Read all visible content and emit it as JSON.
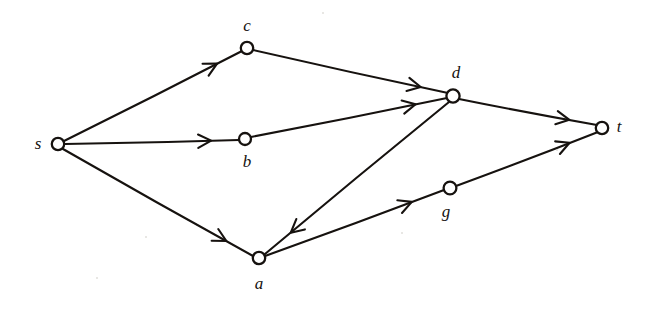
{
  "figure": {
    "background_color": "#ffffff",
    "ink_color": "#16120f",
    "width": 646,
    "height": 311
  },
  "nodes": [
    {
      "id": "s",
      "label": "s",
      "cx": 58,
      "cy": 144,
      "r": 6.2,
      "label_x": 38,
      "label_y": 143
    },
    {
      "id": "c",
      "label": "c",
      "cx": 247,
      "cy": 48,
      "r": 6.2,
      "label_x": 247,
      "label_y": 25
    },
    {
      "id": "b",
      "label": "b",
      "cx": 245,
      "cy": 139,
      "r": 6.0,
      "label_x": 247,
      "label_y": 161
    },
    {
      "id": "a",
      "label": "a",
      "cx": 259,
      "cy": 258,
      "r": 6.2,
      "label_x": 259,
      "label_y": 283
    },
    {
      "id": "d",
      "label": "d",
      "cx": 453,
      "cy": 96,
      "r": 6.6,
      "label_x": 456,
      "label_y": 72
    },
    {
      "id": "g",
      "label": "g",
      "cx": 450,
      "cy": 188,
      "r": 6.4,
      "label_x": 446,
      "label_y": 211
    },
    {
      "id": "t",
      "label": "t",
      "cx": 602,
      "cy": 128,
      "r": 6.2,
      "label_x": 619,
      "label_y": 126
    }
  ],
  "edges": [
    {
      "id": "s-c",
      "from": "s",
      "to": "c",
      "x1": 64,
      "y1": 141,
      "x2": 242,
      "y2": 51,
      "arrow_t": 0.86
    },
    {
      "id": "s-b",
      "from": "s",
      "to": "b",
      "x1": 65,
      "y1": 144,
      "x2": 239,
      "y2": 140,
      "arrow_t": 0.84
    },
    {
      "id": "s-a",
      "from": "s",
      "to": "a",
      "x1": 63,
      "y1": 149,
      "x2": 253,
      "y2": 256,
      "arrow_t": 0.86
    },
    {
      "id": "c-d",
      "from": "c",
      "to": "d",
      "x1": 253,
      "y1": 50,
      "x2": 448,
      "y2": 93,
      "arrow_t": 0.86
    },
    {
      "id": "b-d",
      "from": "b",
      "to": "d",
      "x1": 251,
      "y1": 137,
      "x2": 447,
      "y2": 98,
      "arrow_t": 0.84
    },
    {
      "id": "d-a",
      "from": "d",
      "to": "a",
      "x1": 449,
      "y1": 102,
      "x2": 265,
      "y2": 254,
      "arrow_t": 0.86
    },
    {
      "id": "d-t",
      "from": "d",
      "to": "t",
      "x1": 459,
      "y1": 99,
      "x2": 597,
      "y2": 125,
      "arrow_t": 0.8
    },
    {
      "id": "a-g",
      "from": "a",
      "to": "g",
      "x1": 265,
      "y1": 256,
      "x2": 444,
      "y2": 190,
      "arrow_t": 0.82
    },
    {
      "id": "g-t",
      "from": "g",
      "to": "t",
      "x1": 456,
      "y1": 186,
      "x2": 598,
      "y2": 132,
      "arrow_t": 0.8
    }
  ],
  "specks": [
    {
      "x": 145,
      "y": 236,
      "size": 2
    },
    {
      "x": 401,
      "y": 232,
      "size": 2
    },
    {
      "x": 556,
      "y": 149,
      "size": 2
    },
    {
      "x": 322,
      "y": 12,
      "size": 2
    },
    {
      "x": 96,
      "y": 277,
      "size": 2
    }
  ]
}
